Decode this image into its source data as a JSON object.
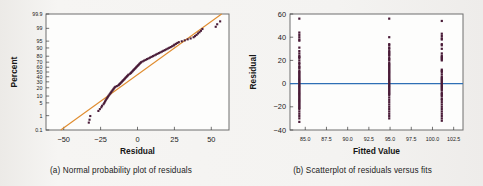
{
  "figure": {
    "background_color": "#f3f2f0",
    "point_color": "#4a1c38"
  },
  "panel_a": {
    "caption": "(a) Normal probability plot of residuals",
    "xlabel": "Residual",
    "ylabel": "Percent",
    "refline_color": "#e08c2e"
  },
  "panel_b": {
    "caption": "(b) Scatterplot of residuals versus fits",
    "xlabel": "Fitted Value",
    "ylabel": "Residual",
    "refline_color": "#2f6fb5",
    "refline_value": 0
  },
  "chart_data": [
    {
      "type": "scatter",
      "id": "normal-probability-plot",
      "title": "(a) Normal probability plot of residuals",
      "xlabel": "Residual",
      "ylabel": "Percent",
      "xlim": [
        -62,
        62
      ],
      "ylim_percent": [
        0.1,
        99.9
      ],
      "yscale": "normal-probability",
      "xticks": [
        -50,
        -25,
        0,
        25,
        50
      ],
      "xticklabels": [
        "−50",
        "−25",
        "0",
        "25",
        "50"
      ],
      "yticks": [
        0.1,
        1,
        5,
        10,
        20,
        30,
        40,
        50,
        60,
        70,
        80,
        90,
        95,
        99,
        99.9
      ],
      "yticklabels": [
        "0.1",
        "1",
        "5",
        "10",
        "20",
        "30",
        "40",
        "50",
        "60",
        "70",
        "80",
        "90",
        "95",
        "99",
        "99.9"
      ],
      "grid": false,
      "legend": "none",
      "reference_line": {
        "type": "normal-fit-line",
        "color": "#e08c2e",
        "x_at_p0_1": -52,
        "x_at_p99_9": 57
      },
      "series": [
        {
          "name": "residuals",
          "color": "#4a1c38",
          "marker": "square",
          "points": [
            [
              -33.0,
              0.35
            ],
            [
              -32.5,
              0.55
            ],
            [
              -32.0,
              0.95
            ],
            [
              -26.5,
              1.9
            ],
            [
              -25.5,
              2.4
            ],
            [
              -24.5,
              3.0
            ],
            [
              -24.0,
              3.6
            ],
            [
              -23.0,
              4.3
            ],
            [
              -22.5,
              5.0
            ],
            [
              -22.0,
              5.8
            ],
            [
              -21.5,
              6.6
            ],
            [
              -21.0,
              7.5
            ],
            [
              -20.5,
              8.4
            ],
            [
              -20.0,
              9.4
            ],
            [
              -19.5,
              10.4
            ],
            [
              -19.0,
              11.5
            ],
            [
              -18.5,
              12.6
            ],
            [
              -18.0,
              13.8
            ],
            [
              -17.5,
              15.0
            ],
            [
              -17.0,
              16.3
            ],
            [
              -16.5,
              17.6
            ],
            [
              -16.0,
              19.0
            ],
            [
              -15.5,
              20.4
            ],
            [
              -15.0,
              21.5
            ],
            [
              -14.0,
              22.6
            ],
            [
              -13.0,
              23.8
            ],
            [
              -12.5,
              25.0
            ],
            [
              -12.0,
              26.3
            ],
            [
              -11.5,
              27.6
            ],
            [
              -11.0,
              29.0
            ],
            [
              -10.5,
              30.4
            ],
            [
              -10.0,
              31.9
            ],
            [
              -9.5,
              33.4
            ],
            [
              -9.0,
              34.9
            ],
            [
              -8.5,
              36.5
            ],
            [
              -8.0,
              38.1
            ],
            [
              -7.5,
              39.7
            ],
            [
              -7.0,
              41.3
            ],
            [
              -6.5,
              43.0
            ],
            [
              -6.0,
              44.6
            ],
            [
              -5.0,
              46.3
            ],
            [
              -4.5,
              48.0
            ],
            [
              -4.0,
              49.6
            ],
            [
              -3.5,
              51.3
            ],
            [
              -3.0,
              53.0
            ],
            [
              -2.5,
              54.6
            ],
            [
              -2.0,
              56.3
            ],
            [
              -1.5,
              57.9
            ],
            [
              -1.0,
              59.5
            ],
            [
              -0.5,
              61.1
            ],
            [
              0.0,
              62.7
            ],
            [
              0.5,
              64.2
            ],
            [
              1.0,
              65.7
            ],
            [
              1.5,
              67.2
            ],
            [
              2.0,
              68.6
            ],
            [
              2.5,
              70.0
            ],
            [
              3.5,
              71.4
            ],
            [
              4.5,
              72.8
            ],
            [
              5.5,
              74.1
            ],
            [
              6.5,
              75.4
            ],
            [
              7.5,
              76.6
            ],
            [
              8.5,
              77.8
            ],
            [
              9.5,
              79.0
            ],
            [
              10.5,
              80.1
            ],
            [
              11.5,
              81.2
            ],
            [
              12.5,
              82.3
            ],
            [
              13.5,
              83.3
            ],
            [
              14.5,
              84.3
            ],
            [
              15.5,
              85.2
            ],
            [
              16.5,
              86.1
            ],
            [
              17.5,
              87.0
            ],
            [
              18.5,
              87.8
            ],
            [
              19.5,
              88.6
            ],
            [
              20.5,
              89.4
            ],
            [
              21.5,
              90.1
            ],
            [
              22.5,
              90.8
            ],
            [
              23.5,
              91.5
            ],
            [
              24.5,
              92.1
            ],
            [
              25.0,
              92.7
            ],
            [
              26.0,
              93.3
            ],
            [
              27.0,
              93.9
            ],
            [
              28.0,
              94.4
            ],
            [
              30.0,
              94.9
            ],
            [
              32.0,
              95.4
            ],
            [
              34.0,
              95.9
            ],
            [
              36.0,
              96.3
            ],
            [
              38.0,
              96.8
            ],
            [
              39.0,
              97.2
            ],
            [
              40.0,
              97.6
            ],
            [
              41.0,
              98.0
            ],
            [
              42.0,
              98.3
            ],
            [
              43.0,
              98.6
            ],
            [
              44.0,
              98.9
            ],
            [
              53.0,
              99.2
            ],
            [
              54.0,
              99.45
            ],
            [
              56.0,
              99.65
            ]
          ]
        }
      ]
    },
    {
      "type": "scatter",
      "id": "residuals-versus-fits",
      "title": "(b) Scatterplot of residuals versus fits",
      "xlabel": "Fitted Value",
      "ylabel": "Residual",
      "xlim": [
        83.2,
        103.6
      ],
      "ylim": [
        -40,
        60
      ],
      "xticks": [
        85.0,
        87.5,
        90.0,
        92.5,
        95.0,
        97.5,
        100.0,
        102.5
      ],
      "xticklabels": [
        "85.0",
        "87.5",
        "90.0",
        "92.5",
        "95.0",
        "97.5",
        "100.0",
        "102.5"
      ],
      "yticks": [
        -40,
        -20,
        0,
        20,
        40,
        60
      ],
      "yticklabels": [
        "−40",
        "−20",
        "0",
        "20",
        "40",
        "60"
      ],
      "grid": false,
      "legend": "none",
      "reference_line": {
        "type": "hline",
        "y": 0,
        "color": "#2f6fb5"
      },
      "series": [
        {
          "name": "group-84.3",
          "color": "#4a1c38",
          "marker": "square",
          "x": 84.3,
          "y_values": [
            56,
            44,
            42,
            40,
            38,
            37,
            31,
            28,
            26,
            24,
            23,
            22,
            20,
            18,
            17,
            15,
            14,
            13,
            11,
            10,
            9,
            8,
            7,
            6,
            5,
            4,
            3,
            2,
            1,
            0,
            -1,
            -2,
            -3,
            -4,
            -5,
            -6,
            -7,
            -8,
            -9,
            -10,
            -11,
            -12,
            -13,
            -14,
            -15,
            -16,
            -17,
            -18,
            -19,
            -20,
            -21,
            -22,
            -24,
            -26,
            -28,
            -30,
            -33
          ]
        },
        {
          "name": "group-94.9",
          "color": "#4a1c38",
          "marker": "square",
          "x": 94.9,
          "y_values": [
            56,
            40,
            34,
            33,
            31,
            30,
            28,
            27,
            26,
            25,
            24,
            22,
            21,
            20,
            18,
            17,
            16,
            15,
            14,
            13,
            12,
            11,
            10,
            9,
            8,
            7,
            6,
            5,
            4,
            3,
            2,
            1,
            0,
            -1,
            -2,
            -3,
            -4,
            -5,
            -6,
            -7,
            -8,
            -9,
            -10,
            -12,
            -14,
            -16,
            -18,
            -20,
            -22,
            -24,
            -26,
            -28,
            -30
          ]
        },
        {
          "name": "group-101.1",
          "color": "#4a1c38",
          "marker": "square",
          "x": 101.1,
          "y_values": [
            54,
            43,
            41,
            39,
            38,
            34,
            33,
            30,
            26,
            24,
            23,
            22,
            21,
            20,
            12,
            11,
            10,
            8,
            6,
            5,
            4,
            3,
            2,
            1,
            0,
            -1,
            -2,
            -3,
            -4,
            -5,
            -6,
            -8,
            -9,
            -10,
            -11,
            -13,
            -14,
            -16,
            -18,
            -20,
            -22,
            -24,
            -26,
            -28,
            -30,
            -32
          ]
        }
      ]
    }
  ]
}
